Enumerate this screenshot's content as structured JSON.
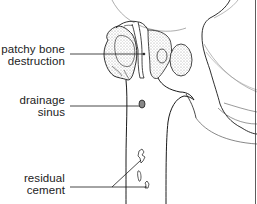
{
  "diagram": {
    "colors": {
      "line": "#1a1a1a",
      "light_line": "#8a8a8a",
      "stipple": "#bdbdbd",
      "background": "#ffffff"
    },
    "labels": [
      {
        "id": "patchy-bone-destruction",
        "lines": [
          "patchy bone",
          "destruction"
        ]
      },
      {
        "id": "drainage-sinus",
        "lines": [
          "drainage",
          "sinus"
        ]
      },
      {
        "id": "residual-cement",
        "lines": [
          "residual",
          "cement"
        ]
      }
    ]
  }
}
